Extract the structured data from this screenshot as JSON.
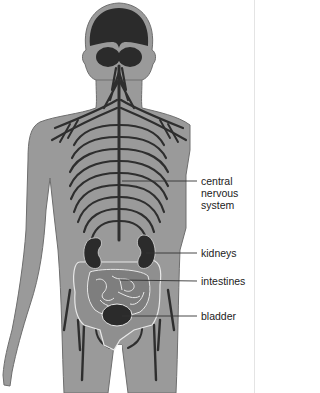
{
  "figure": {
    "colors": {
      "body": "#9a9a9a",
      "body_outline": "#6e6e6e",
      "organs": "#2b2b2b",
      "nerves": "#2e2e2e",
      "intestine_outline": "#e8e8e8",
      "intestine_fill": "#858585",
      "leader": "#333333",
      "background": "#ffffff"
    }
  },
  "labels": [
    {
      "id": "cns",
      "lines": [
        "central",
        "nervous",
        "system"
      ]
    },
    {
      "id": "kidneys",
      "text": "kidneys"
    },
    {
      "id": "intestines",
      "text": "intestines"
    },
    {
      "id": "bladder",
      "text": "bladder"
    }
  ]
}
